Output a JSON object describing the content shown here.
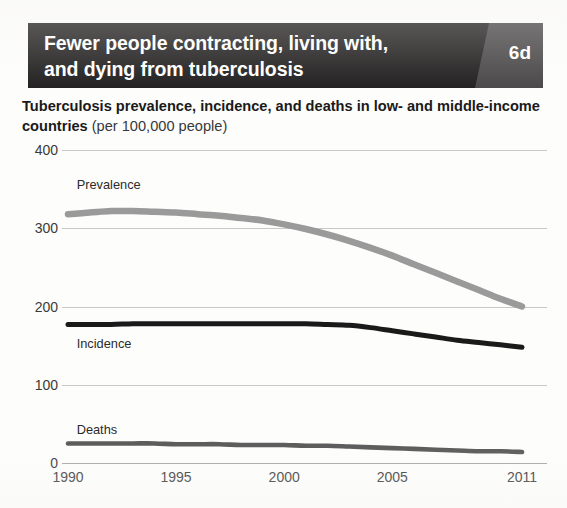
{
  "header": {
    "title_line1": "Fewer people contracting, living with,",
    "title_line2": "and dying from tuberculosis",
    "badge": "6d",
    "bar_color": "#221f20",
    "badge_panel_color": "#4a4749",
    "text_color": "#ffffff"
  },
  "subtitle": {
    "bold_part": "Tuberculosis prevalence, incidence, and deaths in low- and middle-income countries ",
    "light_part": "(per 100,000 people)"
  },
  "chart_data": {
    "type": "line",
    "title": "Tuberculosis prevalence, incidence, and deaths in low- and middle-income countries (per 100,000 people)",
    "xlabel": "",
    "ylabel": "",
    "unit": "per 100,000 people",
    "xlim": [
      1990,
      2011
    ],
    "ylim": [
      0,
      400
    ],
    "ytick_labels": [
      "400",
      "300",
      "200",
      "100",
      "0"
    ],
    "ytick_values": [
      400,
      300,
      200,
      100,
      0
    ],
    "xtick_labels": [
      "1990",
      "1995",
      "2000",
      "2005",
      "2011"
    ],
    "xtick_values": [
      1990,
      1995,
      2000,
      2005,
      2011
    ],
    "grid": true,
    "legend_position": "inline-labels",
    "x": [
      1990,
      1991,
      1992,
      1993,
      1994,
      1995,
      1996,
      1997,
      1998,
      1999,
      2000,
      2001,
      2002,
      2003,
      2004,
      2005,
      2006,
      2007,
      2008,
      2009,
      2010,
      2011
    ],
    "series": [
      {
        "name": "Prevalence",
        "color": "#9a9a9a",
        "label_x": 1990.4,
        "label_y": 355,
        "values": [
          318,
          320,
          322,
          322,
          321,
          320,
          318,
          316,
          313,
          310,
          305,
          299,
          292,
          284,
          275,
          265,
          254,
          243,
          232,
          221,
          210,
          200
        ]
      },
      {
        "name": "Incidence",
        "color": "#1a1a1a",
        "label_x": 1990.4,
        "label_y": 152,
        "values": [
          177,
          177,
          177,
          178,
          178,
          178,
          178,
          178,
          178,
          178,
          178,
          178,
          177,
          176,
          173,
          169,
          165,
          161,
          157,
          154,
          151,
          148
        ]
      },
      {
        "name": "Deaths",
        "color": "#5d5d5d",
        "label_x": 1990.4,
        "label_y": 42,
        "values": [
          25,
          25,
          25,
          25,
          25,
          24,
          24,
          24,
          23,
          23,
          23,
          22,
          22,
          21,
          20,
          19,
          18,
          17,
          16,
          15,
          15,
          14
        ]
      }
    ]
  }
}
